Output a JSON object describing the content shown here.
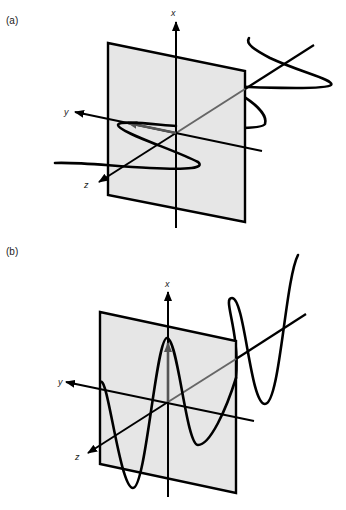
{
  "figure": {
    "panels": [
      {
        "label": "(a)",
        "description": "Circularly polarized wave: helix around propagation axis",
        "axes": {
          "x": "x",
          "y": "y",
          "z": "z"
        }
      },
      {
        "label": "(b)",
        "description": "Linearly polarized wave: sinusoid in x-z plane",
        "axes": {
          "x": "x",
          "y": "y",
          "z": "z"
        }
      }
    ],
    "colors": {
      "plane_fill": "#e6e6e6",
      "line": "#000000",
      "field_vector": "#555555",
      "background": "#ffffff"
    }
  }
}
